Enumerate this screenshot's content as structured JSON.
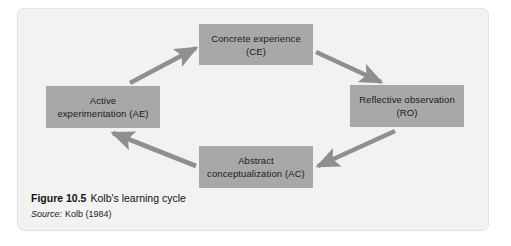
{
  "figure": {
    "frame_background": "#f2f2f2",
    "node_color": "#a8a8a8",
    "arrow_color": "#8f8f8f",
    "caption": {
      "figure_number": "Figure 10.5",
      "title": "Kolb's learning cycle",
      "source_label": "Source:",
      "source_text": "Kolb (1984)"
    }
  },
  "diagram": {
    "type": "cycle",
    "nodes": [
      {
        "id": "ce",
        "line1": "Concrete experience",
        "line2": "(CE)",
        "position": "top"
      },
      {
        "id": "ro",
        "line1": "Reflective observation",
        "line2": "(RO)",
        "position": "right"
      },
      {
        "id": "ac",
        "line1": "Abstract",
        "line2": "conceptualization (AC)",
        "position": "bottom"
      },
      {
        "id": "ae",
        "line1": "Active",
        "line2": "experimentation (AE)",
        "position": "left"
      }
    ],
    "edges": [
      {
        "id": "ce-to-ro",
        "from": "ce",
        "to": "ro",
        "direction": "down-right"
      },
      {
        "id": "ro-to-ac",
        "from": "ro",
        "to": "ac",
        "direction": "down-left"
      },
      {
        "id": "ac-to-ae",
        "from": "ac",
        "to": "ae",
        "direction": "up-left"
      },
      {
        "id": "ae-to-ce",
        "from": "ae",
        "to": "ce",
        "direction": "up-right"
      }
    ]
  }
}
